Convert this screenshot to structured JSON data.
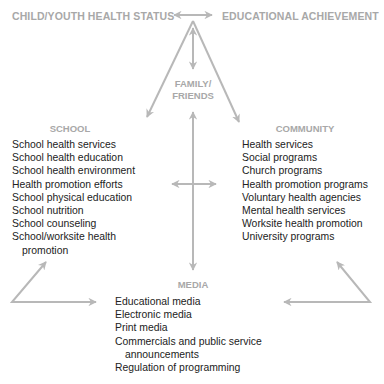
{
  "title_row": {
    "left": "CHILD/YOUTH HEALTH STATUS",
    "right": "EDUCATIONAL ACHIEVEMENT"
  },
  "family": {
    "line1": "FAMILY/",
    "line2": "FRIENDS"
  },
  "school": {
    "heading": "SCHOOL",
    "items": [
      "School health services",
      "School health education",
      "School health environment",
      "Health promotion efforts",
      "School physical education",
      "School nutrition",
      "School counseling",
      "School/worksite health",
      "promotion"
    ]
  },
  "community": {
    "heading": "COMMUNITY",
    "items": [
      "Health services",
      "Social programs",
      "Church programs",
      "Health promotion programs",
      "Voluntary health agencies",
      "Mental health services",
      "Worksite health promotion",
      "University programs"
    ]
  },
  "media": {
    "heading": "MEDIA",
    "items": [
      "Educational media",
      "Electronic media",
      "Print media",
      "Commercials and public service",
      "announcements",
      "Regulation of programming"
    ]
  },
  "colors": {
    "arrow": "#b8b8b8",
    "heading": "#a8a8a8",
    "text": "#222222"
  }
}
